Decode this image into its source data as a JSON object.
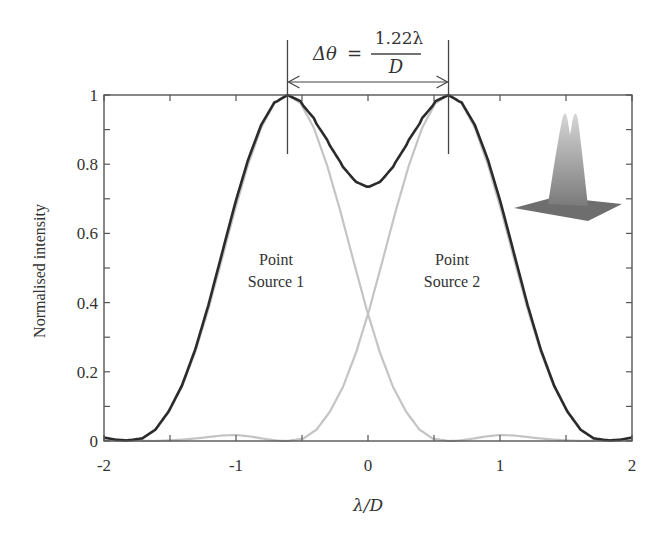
{
  "chart_data": {
    "type": "line",
    "title": "",
    "xlabel": "λ/D",
    "ylabel": "Normalised intensity",
    "xlim": [
      -2,
      2
    ],
    "ylim": [
      0,
      1
    ],
    "grid": false,
    "legend": null,
    "x_ticks": [
      -2,
      -1,
      0,
      1,
      2
    ],
    "x_tick_labels": [
      "-2",
      "-1",
      "0",
      "1",
      "2"
    ],
    "x_minor_ticks": [
      -1.5,
      -0.5,
      0.5,
      1.5
    ],
    "y_ticks": [
      0,
      0.2,
      0.4,
      0.6,
      0.8,
      1
    ],
    "y_tick_labels": [
      "0",
      "0.2",
      "0.4",
      "0.6",
      "0.8",
      "1"
    ],
    "y_minor_ticks": [
      0.1,
      0.3,
      0.5,
      0.7,
      0.9
    ],
    "source_positions": [
      -0.61,
      0.61
    ],
    "airy_profile": {
      "u": [
        0,
        0.1,
        0.2,
        0.3,
        0.4,
        0.5,
        0.6,
        0.7,
        0.8,
        0.9,
        1.0,
        1.1,
        1.22,
        1.3,
        1.4,
        1.5,
        1.6,
        1.7,
        1.8,
        1.9,
        2.0,
        2.1,
        2.23,
        2.4,
        2.61,
        2.8
      ],
      "i": [
        1,
        0.976,
        0.905,
        0.797,
        0.665,
        0.521,
        0.38,
        0.256,
        0.156,
        0.084,
        0.033,
        0.007,
        0,
        0.001,
        0.0065,
        0.013,
        0.017,
        0.0164,
        0.0124,
        0.0079,
        0.0046,
        0.002,
        0,
        0.001,
        0.0042,
        0.003
      ]
    },
    "series": [
      {
        "name": "Point Source 1",
        "color": "#c4c4c4",
        "peak_x": -0.61,
        "peak_y": 1.0
      },
      {
        "name": "Point Source 2",
        "color": "#c4c4c4",
        "peak_x": 0.61,
        "peak_y": 1.0
      },
      {
        "name": "Combined",
        "color": "#2b2b2b",
        "peak_x": [
          -0.61,
          0.61
        ],
        "peak_y": 1.0,
        "center_dip_y": 0.74
      }
    ],
    "crossing_point": {
      "x": 0,
      "y": 0.37
    },
    "annotations": [
      {
        "text": "Point Source 1",
        "x": -0.95,
        "y": 0.5
      },
      {
        "text": "Point Source 2",
        "x": 0.95,
        "y": 0.5
      },
      {
        "text": "Δθ = 1.22λ / D",
        "type": "double-arrow",
        "from": -0.61,
        "to": 0.61
      }
    ],
    "inset": "3D surface plot of two overlapping intensity peaks"
  },
  "labels": {
    "ylabel": "Normalised intensity",
    "xlabel": "λ/D",
    "source1_line1": "Point",
    "source1_line2": "Source 1",
    "source2_line1": "Point",
    "source2_line2": "Source 2",
    "formula_lhs": "Δθ",
    "formula_eq": "=",
    "formula_num": "1.22λ",
    "formula_den": "D"
  },
  "colors": {
    "combined": "#2b2b2b",
    "individual": "#c4c4c4",
    "axis": "#555555"
  }
}
